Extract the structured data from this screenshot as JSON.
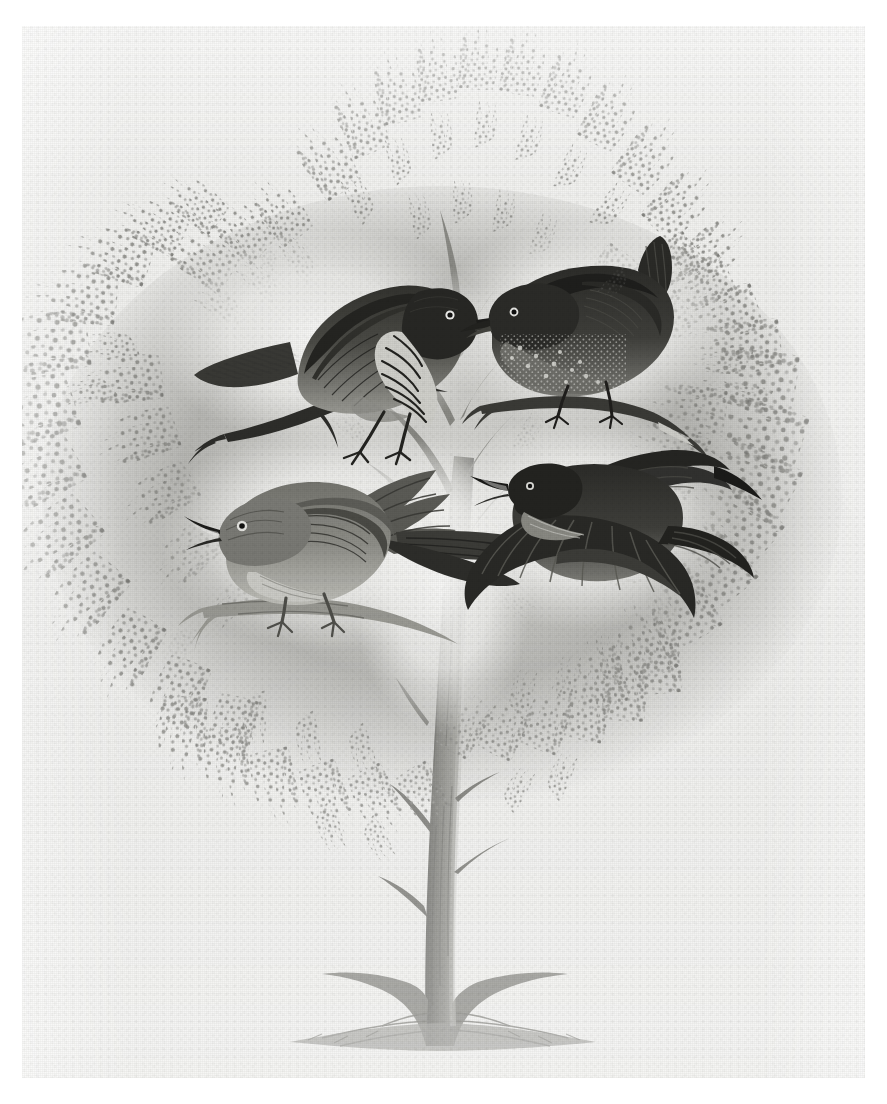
{
  "plate": {
    "medium": "wood engraving",
    "palette": {
      "paper": "#f1f1ef",
      "margin": "#ffffff",
      "foliage_light": "#b9b9b6",
      "foliage_mid": "#9a9a96",
      "foliage_dark": "#7e7e7a",
      "trunk": "#8b8b86",
      "trunk_shadow": "#6f6f6b",
      "bird_dark": "#2b2b29",
      "bird_mid": "#63635f",
      "bird_light": "#a8a8a3",
      "halo": "#f7f7f5",
      "ground": "#8f8f8a"
    },
    "scene": {
      "subject": "four birds perched in and flying about a single broad-crowned tree",
      "tree": {
        "name": "tree",
        "crown_style": "feathery stippled conifer-like sprays",
        "trunk_description": "slender trunk with short broken stubs, flaring into buttressed roots",
        "ground_description": "low tufted ground line at the base"
      }
    },
    "birds": [
      {
        "id": "bird-upper-left",
        "name": "thrush perched on branch",
        "pose": "perched, facing right",
        "plumage": "dark streaked back with heavily streaked pale breast",
        "tail": "long, held low and angled back-left",
        "perch": "forked twig"
      },
      {
        "id": "bird-upper-right",
        "name": "wren with cocked tail",
        "pose": "perched, facing left",
        "plumage": "dark mottled and spotted body",
        "tail": "short, cocked sharply upward",
        "perch": "bare twig"
      },
      {
        "id": "bird-lower-left",
        "name": "singing bird with raised wings",
        "pose": "perched, facing left, beak open in song",
        "plumage": "mid-grey body with darker wings",
        "tail": "long and fanned, swept back-right",
        "perch": "horizontal twig"
      },
      {
        "id": "bird-lower-right",
        "name": "bird in flight",
        "pose": "flying left, wings fully spread",
        "plumage": "dark back with barred spread wings and tail",
        "tail": "short and spread",
        "perch": "none"
      }
    ]
  }
}
